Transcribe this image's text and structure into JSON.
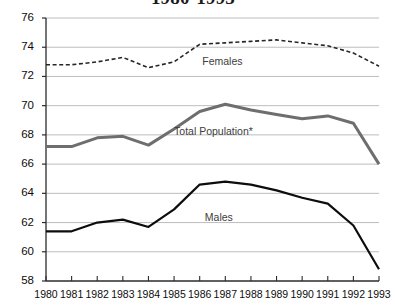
{
  "chart_data": {
    "type": "line",
    "title": "1980-1993",
    "xlabel": "",
    "ylabel": "",
    "x": [
      1980,
      1981,
      1982,
      1983,
      1984,
      1985,
      1986,
      1987,
      1988,
      1989,
      1990,
      1991,
      1992,
      1993
    ],
    "xticklabels": [
      "1980",
      "1981",
      "1982",
      "1983",
      "1984",
      "1985",
      "1986",
      "1987",
      "1988",
      "1989",
      "1990",
      "1991",
      "1992",
      "1993"
    ],
    "yticklabels": [
      "58",
      "60",
      "62",
      "64",
      "66",
      "68",
      "70",
      "72",
      "74",
      "76"
    ],
    "yticks": [
      58,
      60,
      62,
      64,
      66,
      68,
      70,
      72,
      74,
      76
    ],
    "ylim": [
      58,
      76
    ],
    "xlim": [
      1980,
      1993
    ],
    "grid": true,
    "grid_axis": "y",
    "legend_position": "inline-annotations",
    "series": [
      {
        "name": "Females",
        "label": "Females",
        "style": "dashed",
        "color": "#262626",
        "width": 1.6,
        "values": [
          72.8,
          72.8,
          73.0,
          73.3,
          72.6,
          73.0,
          74.2,
          74.3,
          74.4,
          74.5,
          74.3,
          74.1,
          73.6,
          72.7
        ]
      },
      {
        "name": "Total Population*",
        "label": "Total Population*",
        "style": "solid",
        "color": "#6e6e6e",
        "width": 3.0,
        "values": [
          67.2,
          67.2,
          67.8,
          67.9,
          67.3,
          68.4,
          69.6,
          70.1,
          69.7,
          69.4,
          69.1,
          69.3,
          68.8,
          66.0
        ]
      },
      {
        "name": "Males",
        "label": "Males",
        "style": "solid",
        "color": "#0d0d0d",
        "width": 2.2,
        "values": [
          61.4,
          61.4,
          62.0,
          62.2,
          61.7,
          62.9,
          64.6,
          64.8,
          64.6,
          64.2,
          63.7,
          63.3,
          61.8,
          58.8
        ]
      }
    ],
    "annotations": [
      {
        "text": "Females",
        "x": 1986.1,
        "y": 73.0
      },
      {
        "text": "Total Population*",
        "x": 1985.0,
        "y": 68.2
      },
      {
        "text": "Males",
        "x": 1986.2,
        "y": 62.3
      }
    ],
    "colors": {
      "axis": "#2b2b2b",
      "grid": "#b5b5b5",
      "females": "#262626",
      "total": "#6e6e6e",
      "males": "#0d0d0d",
      "background": "#ffffff"
    }
  }
}
